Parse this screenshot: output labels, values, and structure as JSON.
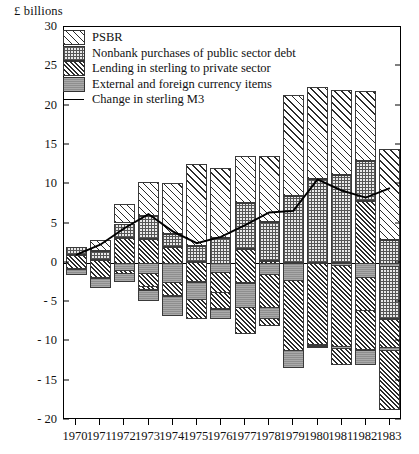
{
  "axis_unit_label": "£ billions",
  "legend": {
    "items": [
      {
        "label": "PSBR",
        "pattern": "p-psbr",
        "icon": "hatch-sparse-swatch"
      },
      {
        "label": "Nonbank purchases of public sector debt",
        "pattern": "p-nonbank",
        "icon": "checker-swatch"
      },
      {
        "label": "Lending in sterling to private sector",
        "pattern": "p-lending",
        "icon": "hatch-dense-swatch"
      },
      {
        "label": "External and foreign currency items",
        "pattern": "p-external",
        "icon": "solid-grey-swatch"
      }
    ],
    "line_item": {
      "label": "Change in sterling M3",
      "icon": "line-swatch"
    }
  },
  "chart_data": {
    "type": "bar",
    "stacked": true,
    "title": "",
    "xlabel": "",
    "ylabel": "£ billions",
    "ylim": [
      -20,
      30
    ],
    "yticks": [
      30,
      25,
      20,
      15,
      10,
      5,
      0,
      "- 5",
      "- 10",
      "- 15",
      "- 20"
    ],
    "ytick_values": [
      30,
      25,
      20,
      15,
      10,
      5,
      0,
      -5,
      -10,
      -15,
      -20
    ],
    "grid": false,
    "legend_position": "top-left",
    "categories": [
      "1970",
      "1971",
      "1972",
      "1973",
      "1974",
      "1975",
      "1976",
      "1977",
      "1978",
      "1979",
      "1980",
      "1981",
      "1982",
      "1983"
    ],
    "series": [
      {
        "name": "PSBR",
        "pattern": "p-psbr",
        "values": [
          0.0,
          1.4,
          2.5,
          4.4,
          6.4,
          10.5,
          9.0,
          6.0,
          8.4,
          12.8,
          11.8,
          10.8,
          8.9,
          11.6
        ]
      },
      {
        "name": "Nonbank purchases of public sector debt",
        "pattern": "p-nonbank",
        "values": [
          1.0,
          1.2,
          1.8,
          2.9,
          1.7,
          2.0,
          3.4,
          5.8,
          5.0,
          8.5,
          10.6,
          11.2,
          5.0,
          10.0
        ]
      },
      {
        "name": "Lending in sterling to private sector",
        "pattern": "p-lending",
        "values": [
          1.8,
          2.2,
          5.0,
          6.1,
          3.8,
          2.6,
          3.6,
          4.4,
          8.2,
          11.2,
          10.5,
          13.0,
          14.0,
          11.6
        ]
      },
      {
        "name": "External and foreign currency items",
        "pattern": "p-external",
        "values": [
          0.8,
          1.3,
          -1.1,
          -1.4,
          -2.6,
          2.2,
          -1.3,
          3.1,
          -1.6,
          -2.3,
          0.2,
          -0.4,
          -1.9,
          -0.5
        ]
      }
    ],
    "bar_totals_positive": [
      2.0,
      2.9,
      7.5,
      10.3,
      10.1,
      12.6,
      12.1,
      13.6,
      13.6,
      21.3,
      22.4,
      22.0,
      21.8,
      14.5
    ],
    "bar_totals_negative": [
      -1.0,
      -1.5,
      -2.4,
      -4.8,
      -6.8,
      -7.1,
      -7.2,
      -9.0,
      -7.2,
      -13.4,
      -10.9,
      -11.0,
      -13.0,
      -11.2
    ],
    "line_series": {
      "name": "Change in sterling M3",
      "type": "line",
      "x": [
        "1970",
        "1971",
        "1972",
        "1973",
        "1974",
        "1975",
        "1976",
        "1977",
        "1978",
        "1979",
        "1980",
        "1981",
        "1982",
        "1983"
      ],
      "values": [
        1.0,
        2.3,
        4.4,
        6.2,
        4.0,
        2.5,
        3.3,
        4.8,
        6.4,
        6.6,
        10.6,
        9.2,
        8.3,
        9.5
      ]
    }
  }
}
